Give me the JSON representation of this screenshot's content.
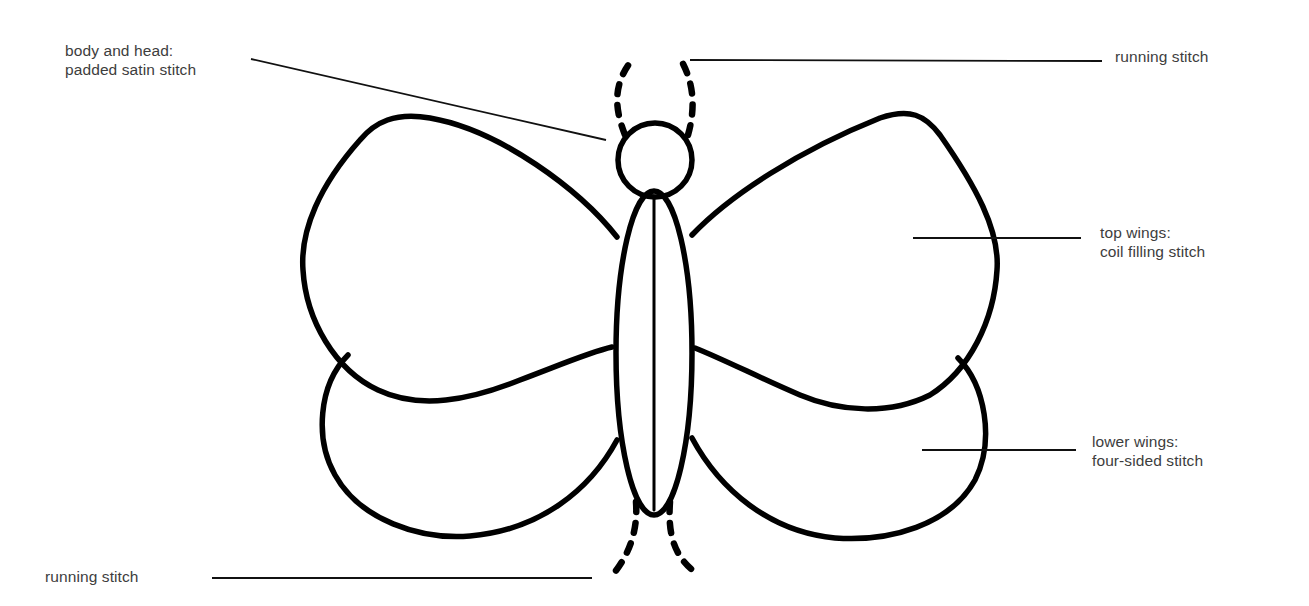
{
  "diagram": {
    "stroke_color": "#000000",
    "background_color": "#ffffff",
    "label_color": "#3d3d3d",
    "parts": [
      {
        "id": "antennae",
        "shape": "dashed curves"
      },
      {
        "id": "head",
        "shape": "circle"
      },
      {
        "id": "body",
        "shape": "elongated ellipse with center line"
      },
      {
        "id": "top-wings",
        "shape": "rounded lobes"
      },
      {
        "id": "lower-wings",
        "shape": "rounded lobes"
      },
      {
        "id": "tail-legs",
        "shape": "dashed curves"
      }
    ]
  },
  "labels": {
    "body_head": {
      "line1": "body and head:",
      "line2": "padded satin stitch"
    },
    "top_running": {
      "line1": "running stitch"
    },
    "top_wings": {
      "line1": "top wings:",
      "line2": "coil filling stitch"
    },
    "lower_wings": {
      "line1": "lower wings:",
      "line2": "four-sided stitch"
    },
    "bottom_running": {
      "line1": "running stitch"
    }
  }
}
